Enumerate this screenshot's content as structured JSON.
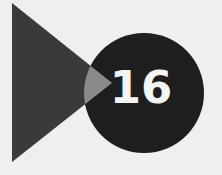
{
  "badge": {
    "number": "16"
  },
  "colors": {
    "background": "#efefef",
    "triangle": "#3a3a3a",
    "circle": "#1e1e1e",
    "overlap": "#8a8a8a",
    "number": "#f4f4f4"
  },
  "icons": {
    "triangle": "play-triangle-icon",
    "circle": "number-circle-icon"
  }
}
